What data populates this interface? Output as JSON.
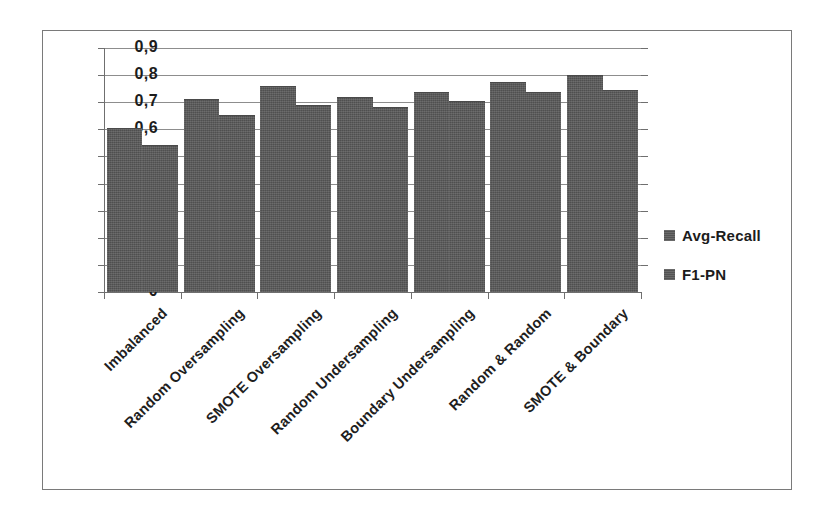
{
  "chart_data": {
    "type": "bar",
    "title": "",
    "xlabel": "",
    "ylabel": "",
    "ylim": [
      0,
      0.9
    ],
    "ytick_labels": [
      "0,9",
      "0,8",
      "0,7",
      "0,6",
      "0,5",
      "0,4",
      "0,3",
      "0,2",
      "0,1",
      "0"
    ],
    "ytick_values": [
      0.9,
      0.8,
      0.7,
      0.6,
      0.5,
      0.4,
      0.3,
      0.2,
      0.1,
      0
    ],
    "grid": true,
    "legend_position": "right",
    "categories": [
      "Imbalanced",
      "Random Oversampling",
      "SMOTE Oversampling",
      "Random Undersampling",
      "Boundary Undersampling",
      "Random & Random",
      "SMOTE & Boundary"
    ],
    "series": [
      {
        "name": "Avg-Recall",
        "color": "#595959",
        "values": [
          0.6,
          0.71,
          0.755,
          0.715,
          0.735,
          0.77,
          0.795
        ]
      },
      {
        "name": "F1-PN",
        "color": "#595959",
        "values": [
          0.54,
          0.65,
          0.685,
          0.68,
          0.7,
          0.735,
          0.74
        ]
      }
    ]
  },
  "legend": {
    "entries": [
      {
        "label": "Avg-Recall",
        "swatch": "legend-swatch-avg-recall"
      },
      {
        "label": "F1-PN",
        "swatch": "legend-swatch-f1-pn"
      }
    ]
  }
}
